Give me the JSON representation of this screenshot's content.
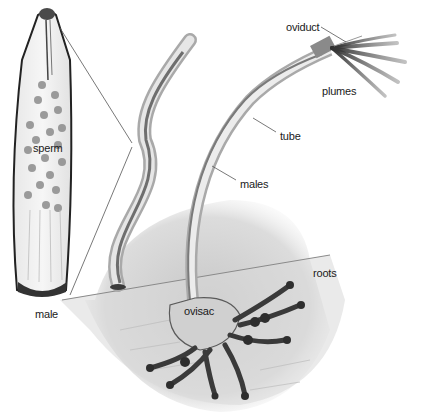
{
  "diagram": {
    "labels": {
      "oviduct": "oviduct",
      "plumes": "plumes",
      "tube": "tube",
      "males": "males",
      "roots": "roots",
      "ovisac": "ovisac",
      "sperm": "sperm",
      "male": "male"
    },
    "colors": {
      "background": "#ffffff",
      "ink": "#1a1a1a",
      "leader_line": "#555555",
      "bone_gray": "#c8c8c8",
      "root_dark": "#3a3a3a"
    }
  }
}
